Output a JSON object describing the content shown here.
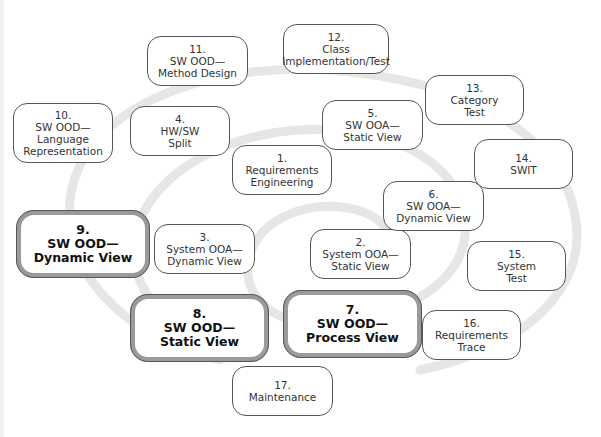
{
  "diagram": {
    "type": "spiral-process",
    "nodes": [
      {
        "id": "1",
        "number": "1.",
        "lines": [
          "Requirements",
          "Engineering"
        ],
        "emphasis": false
      },
      {
        "id": "2",
        "number": "2.",
        "lines": [
          "System OOA—",
          "Static View"
        ],
        "emphasis": false
      },
      {
        "id": "3",
        "number": "3.",
        "lines": [
          "System OOA—",
          "Dynamic View"
        ],
        "emphasis": false
      },
      {
        "id": "4",
        "number": "4.",
        "lines": [
          "HW/SW",
          "Split"
        ],
        "emphasis": false
      },
      {
        "id": "5",
        "number": "5.",
        "lines": [
          "SW OOA—",
          "Static View"
        ],
        "emphasis": false
      },
      {
        "id": "6",
        "number": "6.",
        "lines": [
          "SW OOA—",
          "Dynamic View"
        ],
        "emphasis": false
      },
      {
        "id": "7",
        "number": "7.",
        "lines": [
          "SW OOD—",
          "Process View"
        ],
        "emphasis": true
      },
      {
        "id": "8",
        "number": "8.",
        "lines": [
          "SW OOD—",
          "Static View"
        ],
        "emphasis": true
      },
      {
        "id": "9",
        "number": "9.",
        "lines": [
          "SW OOD—",
          "Dynamic View"
        ],
        "emphasis": true
      },
      {
        "id": "10",
        "number": "10.",
        "lines": [
          "SW OOD—",
          "Language",
          "Representation"
        ],
        "emphasis": false
      },
      {
        "id": "11",
        "number": "11.",
        "lines": [
          "SW OOD—",
          "Method Design"
        ],
        "emphasis": false
      },
      {
        "id": "12",
        "number": "12.",
        "lines": [
          "Class",
          "Implementation/Test"
        ],
        "emphasis": false
      },
      {
        "id": "13",
        "number": "13.",
        "lines": [
          "Category",
          "Test"
        ],
        "emphasis": false
      },
      {
        "id": "14",
        "number": "14.",
        "lines": [
          "SWIT"
        ],
        "emphasis": false
      },
      {
        "id": "15",
        "number": "15.",
        "lines": [
          "System",
          "Test"
        ],
        "emphasis": false
      },
      {
        "id": "16",
        "number": "16.",
        "lines": [
          "Requirements",
          "Trace"
        ],
        "emphasis": false
      },
      {
        "id": "17",
        "number": "17.",
        "lines": [
          "Maintenance"
        ],
        "emphasis": false
      }
    ],
    "colors": {
      "spiral": "#e6e6e6",
      "border": "#555555",
      "emphasis_border": "#9a9a9a",
      "text": "#333333"
    }
  }
}
